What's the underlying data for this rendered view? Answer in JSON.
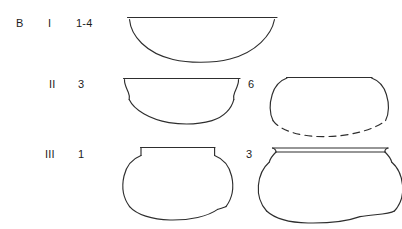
{
  "figure": {
    "group_label": "B",
    "background_color": "#ffffff",
    "stroke_color": "#2e2e2e",
    "rows": [
      {
        "phase": "I",
        "left_count": "1-4",
        "right_count": "",
        "left_vessel": "hemispherical-bowl",
        "right_vessel": ""
      },
      {
        "phase": "II",
        "left_count": "3",
        "right_count": "6",
        "left_vessel": "shallow-bowl-everted-rim",
        "right_vessel": "rounded-jar-dashed-base"
      },
      {
        "phase": "III",
        "left_count": "1",
        "right_count": "3",
        "left_vessel": "necked-globular-jar",
        "right_vessel": "flared-rim-globular-jar"
      }
    ]
  },
  "icons": {
    "vessel_profile": "pottery-profile-icon"
  }
}
